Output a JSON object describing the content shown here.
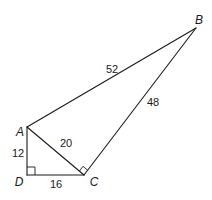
{
  "vertices": {
    "A": {
      "label": "A"
    },
    "B": {
      "label": "B"
    },
    "C": {
      "label": "C"
    },
    "D": {
      "label": "D"
    }
  },
  "sides": {
    "AB": "52",
    "BC": "48",
    "AC": "20",
    "AD": "12",
    "DC": "16"
  },
  "right_angles": [
    "D",
    "C"
  ]
}
